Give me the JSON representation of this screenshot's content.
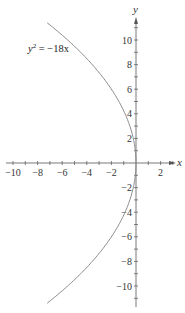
{
  "chart_data": {
    "type": "line",
    "title": "",
    "xlabel": "x",
    "ylabel": "y",
    "equation_label": "y² = −18x",
    "equation_parts": {
      "base": "y",
      "exp": "2",
      "rest": " = −18x"
    },
    "xlim": [
      -10.5,
      3
    ],
    "ylim": [
      -12,
      12
    ],
    "x_ticks": [
      -10,
      -9,
      -8,
      -7,
      -6,
      -5,
      -4,
      -3,
      -2,
      -1,
      1,
      2,
      3
    ],
    "x_tick_labels": [
      "−10",
      "−8",
      "−6",
      "−4",
      "−2",
      "2"
    ],
    "x_tick_label_values": [
      -10,
      -8,
      -6,
      -4,
      -2,
      2
    ],
    "y_ticks": [
      -11,
      -10,
      -9,
      -8,
      -7,
      -6,
      -5,
      -4,
      -3,
      -2,
      -1,
      1,
      2,
      3,
      4,
      5,
      6,
      7,
      8,
      9,
      10,
      11
    ],
    "y_tick_labels": [
      "10",
      "8",
      "6",
      "4",
      "2",
      "−2",
      "−4",
      "−6",
      "−8",
      "−10"
    ],
    "y_tick_label_values": [
      10,
      8,
      6,
      4,
      2,
      -2,
      -4,
      -6,
      -8,
      -10
    ],
    "grid": false,
    "legend": "none",
    "series": [
      {
        "name": "y^2 = -18x",
        "description": "Parabola opening to the left, vertex at origin, focus (-4.5, 0)",
        "y_range": [
          -11.4,
          11.4
        ],
        "points": [
          {
            "x": -7.22,
            "y": 11.4
          },
          {
            "x": -5.56,
            "y": 10
          },
          {
            "x": -3.56,
            "y": 8
          },
          {
            "x": -2.0,
            "y": 6
          },
          {
            "x": -0.89,
            "y": 4
          },
          {
            "x": -0.22,
            "y": 2
          },
          {
            "x": 0,
            "y": 0
          },
          {
            "x": -0.22,
            "y": -2
          },
          {
            "x": -0.89,
            "y": -4
          },
          {
            "x": -2.0,
            "y": -6
          },
          {
            "x": -3.56,
            "y": -8
          },
          {
            "x": -5.56,
            "y": -10
          },
          {
            "x": -7.22,
            "y": -11.4
          }
        ]
      }
    ],
    "colors": {
      "curve": "#8a8a8a",
      "axes": "#555555",
      "text": "#333333"
    }
  }
}
